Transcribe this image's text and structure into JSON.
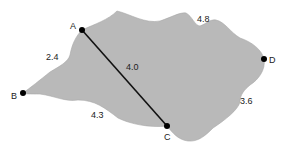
{
  "diagram": {
    "colors": {
      "fill": "#b9b9b9",
      "line": "#111111",
      "text": "#222222"
    },
    "points": [
      {
        "name": "A",
        "x": 82,
        "y": 30
      },
      {
        "name": "B",
        "x": 23,
        "y": 93
      },
      {
        "name": "C",
        "x": 167,
        "y": 126
      },
      {
        "name": "D",
        "x": 264,
        "y": 59
      }
    ],
    "segment": {
      "from": "A",
      "to": "C",
      "length": "4.0"
    },
    "edge_labels": [
      {
        "id": "AB",
        "text": "2.4"
      },
      {
        "id": "AD",
        "text": "4.8"
      },
      {
        "id": "BC",
        "text": "4.3"
      },
      {
        "id": "CD",
        "text": "3.6"
      },
      {
        "id": "AC",
        "text": "4.0"
      }
    ]
  }
}
